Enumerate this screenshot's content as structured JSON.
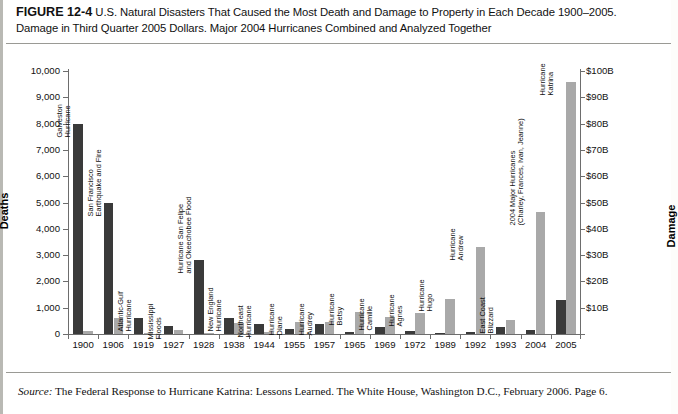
{
  "figure": {
    "number": "FIGURE 12-4",
    "caption": "U.S. Natural Disasters That Caused the Most Death and Damage to Property in Each Decade 1900–2005. Damage in Third Quarter 2005 Dollars. Major 2004 Hurricanes Combined and Analyzed Together",
    "source_prefix": "Source:",
    "source": "The Federal Response to Hurricane Katrina: Lessons Learned. The White House, Washington D.C., February 2006. Page 6."
  },
  "colors": {
    "deaths_bar": "#3a3a3a",
    "damage_bar": "#a9a9a9",
    "axis": "#6d6d6d",
    "frame": "#b9b9b4",
    "background": "#ffffff"
  },
  "chart_data": {
    "type": "bar",
    "title": "U.S. Natural Disasters That Caused the Most Death and Damage to Property in Each Decade 1900–2005",
    "xlabel": "",
    "ylabel": "Deaths",
    "y2label": "Damage",
    "ylim": [
      0,
      10000
    ],
    "y2lim": [
      0,
      100
    ],
    "grid": false,
    "legend": "none",
    "yticks": [
      "0",
      "1,000",
      "2,000",
      "3,000",
      "4,000",
      "5,000",
      "6,000",
      "7,000",
      "8,000",
      "9,000",
      "10,000"
    ],
    "ytick_values": [
      0,
      1000,
      2000,
      3000,
      4000,
      5000,
      6000,
      7000,
      8000,
      9000,
      10000
    ],
    "y2ticks": [
      "$10B",
      "$20B",
      "$30B",
      "$40B",
      "$50B",
      "$60B",
      "$70B",
      "$80B",
      "$90B",
      "$100B"
    ],
    "y2tick_values": [
      10,
      20,
      30,
      40,
      50,
      60,
      70,
      80,
      90,
      100
    ],
    "categories": [
      "1900",
      "1906",
      "1919",
      "1927",
      "1928",
      "1938",
      "1944",
      "1955",
      "1957",
      "1965",
      "1969",
      "1972",
      "1989",
      "1992",
      "1993",
      "2004",
      "2005"
    ],
    "event_labels": [
      [
        "Galveston",
        "Hurricane"
      ],
      [
        "San Francisco",
        "Earthquake and Fire"
      ],
      [
        "Atlantic-Gulf",
        "Hurricane"
      ],
      [
        "Mississippi",
        "Floods"
      ],
      [
        "Hurricane San Felipe",
        "and Okeechobee Flood"
      ],
      [
        "New England",
        "Hurricane"
      ],
      [
        "Northeast",
        "Hurricane"
      ],
      [
        "Hurricane",
        "Diane"
      ],
      [
        "Hurricane",
        "Audrey"
      ],
      [
        "Hurricane",
        "Betsy"
      ],
      [
        "Hurricane",
        "Camille"
      ],
      [
        "Hurricane",
        "Agnes"
      ],
      [
        "Hurricane",
        "Hugo"
      ],
      [
        "Hurricane",
        "Andrew"
      ],
      [
        "East Coast",
        "Blizzard"
      ],
      [
        "2004 Major Hurricanes",
        "(Charley, Frances, Ivan, Jeanne)"
      ],
      [
        "Hurricane",
        "Katrina"
      ]
    ],
    "series": [
      {
        "name": "Deaths",
        "axis": "left",
        "color": "#3a3a3a",
        "values": [
          8000,
          5000,
          600,
          300,
          2800,
          600,
          390,
          190,
          390,
          75,
          255,
          120,
          50,
          60,
          270,
          150,
          1300
        ]
      },
      {
        "name": "Damage",
        "axis": "right",
        "units": "billions of 2005 USD",
        "color": "#a9a9a9",
        "values": [
          1.0,
          6.0,
          0.3,
          1.5,
          0.4,
          4.0,
          0.8,
          4.5,
          4.5,
          8.5,
          6.5,
          8.0,
          13.5,
          33.0,
          5.5,
          46.5,
          96.0
        ]
      }
    ]
  }
}
